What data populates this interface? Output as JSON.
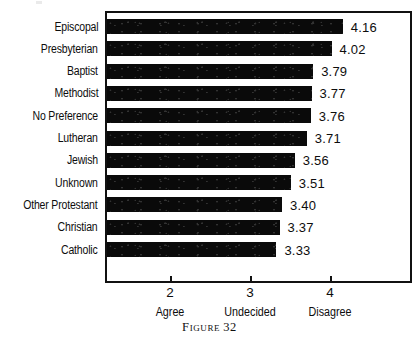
{
  "caption": {
    "word": "Figure",
    "number": "32"
  },
  "chart_data": {
    "type": "bar",
    "orientation": "horizontal",
    "title": "",
    "subtitle": "",
    "xlabel": "",
    "ylabel": "",
    "xlim": [
      1.19,
      4.03
    ],
    "axis_scale_note": "value axis; bars drawn from left frame edge",
    "grid": false,
    "legend": null,
    "xticks": [
      2,
      3,
      4
    ],
    "xtick_labels": [
      "2",
      "3",
      "4"
    ],
    "xtick_anchor_labels": [
      "Agree",
      "Undecided",
      "Disagree"
    ],
    "categories": [
      "Episcopal",
      "Presbyterian",
      "Baptist",
      "Methodist",
      "No Preference",
      "Lutheran",
      "Jewish",
      "Unknown",
      "Other Protestant",
      "Christian",
      "Catholic"
    ],
    "values": [
      4.16,
      4.02,
      3.79,
      3.77,
      3.76,
      3.71,
      3.56,
      3.51,
      3.4,
      3.37,
      3.33
    ],
    "value_labels": [
      "4.16",
      "4.02",
      "3.79",
      "3.77",
      "3.76",
      "3.71",
      "3.56",
      "3.51",
      "3.40",
      "3.37",
      "3.33"
    ],
    "bar_color": "#0a0a0a",
    "background_color": "#ffffff"
  }
}
